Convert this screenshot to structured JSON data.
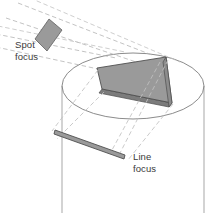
{
  "figure": {
    "background_color": "#ffffff",
    "stroke_color": "#8b8b8b",
    "dark_stroke_color": "#4a4a4a",
    "text_color": "#3a3a3a",
    "fill_gray": "#9a9a9a",
    "fill_gray_light": "#b0b0b0",
    "fill_gray_dark": "#7c7c7c"
  },
  "labels": {
    "spot_focus": {
      "line1": "Spot",
      "line2": "focus"
    },
    "line_focus": {
      "line1": "Line",
      "line2": "focus"
    }
  },
  "elements": {
    "anode_disc": {
      "name": "anode-disc-cylinder",
      "ellipse_cx": 133,
      "ellipse_cy": 86,
      "ellipse_rx": 71,
      "ellipse_ry": 33,
      "left_wall_x": 62,
      "right_wall_x": 204,
      "wall_bottom_y": 213
    },
    "focal_track": {
      "name": "focal-track-slab",
      "fill": "#9a9a9a",
      "side_fill": "#7c7c7c"
    },
    "spot_focus_shape": {
      "name": "spot-focus-parallelogram",
      "fill": "#9a9a9a"
    },
    "line_focus_shape": {
      "name": "line-focus-bar",
      "fill": "#9a9a9a"
    },
    "electron_beam": {
      "name": "electron-beam-rays",
      "style": "dashed",
      "ray_count": 4
    },
    "projection_rays": {
      "name": "projection-rays",
      "style": "dashed",
      "ray_count": 4
    }
  }
}
